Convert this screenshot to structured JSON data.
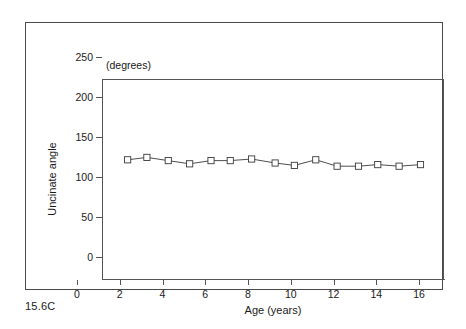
{
  "figure": {
    "caption": "15.6C",
    "units_label": "(degrees)"
  },
  "chart_data": {
    "type": "line",
    "title": "",
    "subtitle": "",
    "xlabel": "Age  (years)",
    "ylabel": "Uncinate angle",
    "units": "(degrees)",
    "xlim": [
      0,
      16
    ],
    "ylim": [
      0,
      250
    ],
    "xticks": [
      0,
      2,
      4,
      6,
      8,
      10,
      12,
      14,
      16
    ],
    "xtick_labels": [
      "0",
      "2",
      "4",
      "6",
      "8",
      "10",
      "12",
      "14",
      "16"
    ],
    "yticks": [
      0,
      50,
      100,
      150,
      200,
      250
    ],
    "ytick_labels": [
      "0",
      "50",
      "100",
      "150",
      "200",
      "250"
    ],
    "grid": false,
    "legend": false,
    "legend_position": "none",
    "marker": "open-square",
    "line_color": "#3a3a3a",
    "marker_color": "#3a3a3a",
    "series": [
      {
        "name": "Uncinate angle",
        "x": [
          1.2,
          2.1,
          3.1,
          4.1,
          5.1,
          6.0,
          7.0,
          8.1,
          9.0,
          10.0,
          11.0,
          12.0,
          12.9,
          13.9,
          14.9
        ],
        "values": [
          149,
          152,
          148,
          144,
          148,
          148,
          150,
          145,
          142,
          149,
          141,
          141,
          143,
          141,
          143
        ]
      }
    ]
  },
  "axes": {
    "y_title": "Uncinate angle",
    "x_title": "Age  (years)"
  }
}
